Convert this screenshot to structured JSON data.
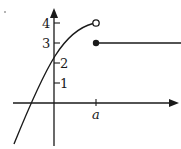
{
  "figure": {
    "y_ticks": [
      {
        "label": "1",
        "value": 1
      },
      {
        "label": "2",
        "value": 2
      },
      {
        "label": "3",
        "value": 3
      },
      {
        "label": "4",
        "value": 4
      }
    ],
    "x_ticks": [
      {
        "label": "a"
      }
    ],
    "left_piece": {
      "shape": "increasing concave-down curve",
      "y_intercept_approx": 2.3,
      "ends_at": {
        "x": "a",
        "y": 4,
        "marker": "open circle"
      }
    },
    "right_piece": {
      "shape": "horizontal line",
      "starts_at": {
        "x": "a",
        "y": 3,
        "marker": "filled dot"
      }
    },
    "colors": {
      "ink": "#1a1a1a",
      "background": "#ffffff"
    }
  }
}
